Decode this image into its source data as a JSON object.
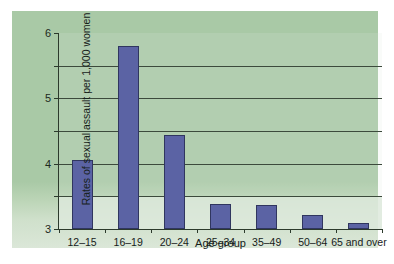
{
  "chart_data": {
    "type": "bar",
    "title": "",
    "xlabel": "Age group",
    "ylabel": "Rates of sexual assault per 1,000 women",
    "categories": [
      "12–15",
      "16–19",
      "20–24",
      "25–34",
      "35–49",
      "50–64",
      "65 and over"
    ],
    "values": [
      2.12,
      5.6,
      2.87,
      0.78,
      0.75,
      0.42,
      0.17
    ],
    "ylim": [
      0,
      6
    ],
    "yticks": [
      "0",
      "1",
      "2",
      "3",
      "4",
      "5",
      "6"
    ],
    "ytick_values": [
      0,
      1,
      2,
      3,
      4,
      5,
      6
    ],
    "grid": true,
    "grid_axis": "y",
    "legend": "none",
    "series": [
      {
        "name": "Rates of sexual assault per 1,000 women",
        "values": [
          2.12,
          5.6,
          2.87,
          0.78,
          0.75,
          0.42,
          0.17
        ],
        "color": "#5b63a4"
      }
    ]
  },
  "colors": {
    "bar_fill": "#5b63a4",
    "bar_edge": "#30365f",
    "panel_background_top": "#a9c9a6",
    "panel_background_bottom": "#dbe7d8",
    "axis": "#2c3a2c",
    "gridline": "#3c4a3c",
    "text": "#16211a",
    "page_background": "#ffffff"
  }
}
